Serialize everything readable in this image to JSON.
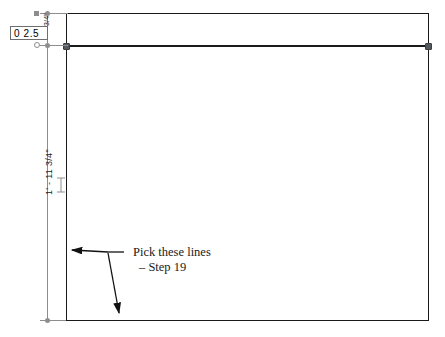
{
  "drawing": {
    "type": "cad-2d-elevation-sketch",
    "background_color": "#ffffff",
    "geometry_color": "#1a1a1a",
    "dimension_color": "#8d8d8d",
    "grip_color": "#555a5e"
  },
  "dimension_edit_box": {
    "value": "0 2.5",
    "placeholder": "0 2.5"
  },
  "dimensions": [
    {
      "name": "overall-height",
      "text": "1' - 11 3/4\"",
      "orientation": "vertical"
    },
    {
      "name": "band-height",
      "text": "3/4\"",
      "orientation": "vertical"
    }
  ],
  "annotation": {
    "line1": "Pick these lines",
    "line2": "– Step 19"
  }
}
